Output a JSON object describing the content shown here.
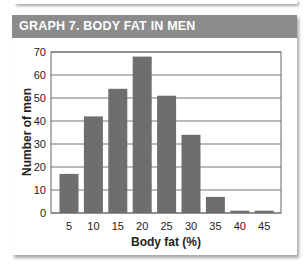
{
  "header": {
    "title": "GRAPH 7. BODY FAT IN MEN"
  },
  "colors": {
    "banner": "#8c8c8c",
    "bar": "#6e6e6e",
    "grid": "#777777"
  },
  "chart_data": {
    "type": "bar",
    "title": "GRAPH 7. BODY FAT IN MEN",
    "xlabel": "Body fat (%)",
    "ylabel": "Number of men",
    "categories": [
      "5",
      "10",
      "15",
      "20",
      "25",
      "30",
      "35",
      "40",
      "45"
    ],
    "values": [
      17,
      42,
      54,
      68,
      51,
      34,
      7,
      1,
      1
    ],
    "ylim": [
      0,
      70
    ],
    "yticks": [
      0,
      10,
      20,
      30,
      40,
      50,
      60,
      70
    ],
    "grid": true,
    "legend": null
  }
}
